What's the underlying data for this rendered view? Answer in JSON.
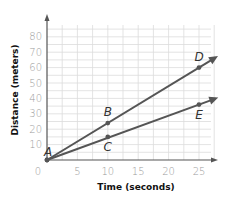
{
  "chart_data": {
    "type": "line",
    "title": "",
    "xlabel": "Time (seconds)",
    "ylabel": "Distance (meters)",
    "xlim": [
      0,
      25
    ],
    "ylim": [
      0,
      80
    ],
    "x_ticks": [
      0,
      5,
      10,
      15,
      20,
      25
    ],
    "y_ticks": [
      10,
      20,
      30,
      40,
      50,
      60,
      70,
      80
    ],
    "grid": true,
    "legend": null,
    "series": [
      {
        "name": "Line ABD",
        "points": [
          {
            "label": "A",
            "x": 0,
            "y": 0
          },
          {
            "label": "B",
            "x": 10,
            "y": 24
          },
          {
            "label": "D",
            "x": 25,
            "y": 60
          }
        ]
      },
      {
        "name": "Line ACE",
        "points": [
          {
            "label": "A",
            "x": 0,
            "y": 0
          },
          {
            "label": "C",
            "x": 10,
            "y": 15
          },
          {
            "label": "E",
            "x": 25,
            "y": 36
          }
        ]
      }
    ],
    "point_labels": [
      "A",
      "B",
      "C",
      "D",
      "E"
    ],
    "origin_label": "0"
  },
  "colors": {
    "line": "#555555",
    "grid": "#dcdcdc",
    "tick_text": "#9a9a9a",
    "axis_title": "#111111"
  }
}
